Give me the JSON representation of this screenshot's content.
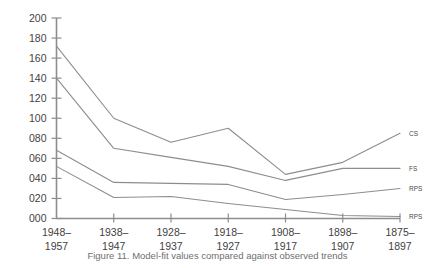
{
  "chart_data": {
    "type": "line",
    "title": "",
    "xlabel": "",
    "ylabel": "",
    "ylim": [
      0,
      200
    ],
    "ytick_labels": [
      "000",
      "020",
      "040",
      "060",
      "080",
      "100",
      "120",
      "140",
      "160",
      "180",
      "200"
    ],
    "ytick_values": [
      0,
      20,
      40,
      60,
      80,
      100,
      120,
      140,
      160,
      180,
      200
    ],
    "grid": false,
    "legend_position": "right-end-of-line",
    "categories": [
      "1948–\n1957",
      "1938–\n1947",
      "1928–\n1937",
      "1918–\n1927",
      "1908–\n1917",
      "1898–\n1907",
      "1875–\n1897"
    ],
    "categories_top": [
      "1948–",
      "1938–",
      "1928–",
      "1918–",
      "1908–",
      "1898–",
      "1875–"
    ],
    "categories_bottom": [
      "1957",
      "1947",
      "1937",
      "1927",
      "1917",
      "1907",
      "1897"
    ],
    "series": [
      {
        "name": "CS",
        "values": [
          172,
          100,
          76,
          90,
          44,
          56,
          85
        ]
      },
      {
        "name": "FS",
        "values": [
          140,
          70,
          61,
          52,
          38,
          50,
          50
        ]
      },
      {
        "name": "RPS",
        "values": [
          68,
          36,
          35,
          34,
          19,
          24,
          30
        ]
      },
      {
        "name": "RPS",
        "values": [
          52,
          21,
          22,
          15,
          9,
          3,
          2
        ]
      }
    ]
  },
  "caption": {
    "text": "Figure 11. Model-fit values compared against observed trends"
  }
}
